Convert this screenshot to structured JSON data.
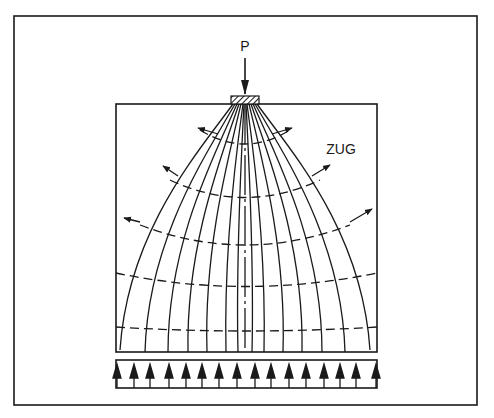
{
  "figure": {
    "load_label": "P",
    "tension_label": "ZUG",
    "colors": {
      "ink": "#1a1a1a",
      "background": "#ffffff"
    },
    "num_trajectories": 15,
    "num_support_arrows": 16,
    "num_tension_bands": 5
  }
}
